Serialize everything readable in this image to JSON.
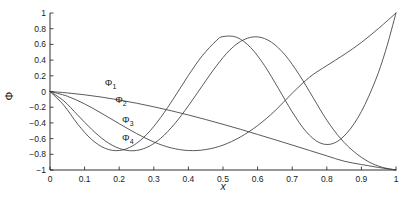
{
  "chart_data": {
    "type": "line",
    "title": "",
    "xlabel": "x",
    "ylabel": "Φ",
    "xlim": [
      0,
      1
    ],
    "ylim": [
      -1,
      1
    ],
    "xticks": [
      "0",
      "0.1",
      "0.2",
      "0.3",
      "0.4",
      "0.5",
      "0.6",
      "0.7",
      "0.8",
      "0.9",
      "1"
    ],
    "xtick_values": [
      0,
      0.1,
      0.2,
      0.3,
      0.4,
      0.5,
      0.6,
      0.7,
      0.8,
      0.9,
      1
    ],
    "yticks": [
      "1",
      "0.8",
      "0.6",
      "0.4",
      "0.2",
      "0",
      "-0.2",
      "-0.4",
      "-0.6",
      "-0.8",
      "-1"
    ],
    "ytick_values": [
      1,
      0.8,
      0.6,
      0.4,
      0.2,
      0,
      -0.2,
      -0.4,
      -0.6,
      -0.8,
      -1
    ],
    "grid": false,
    "legend": "inline-annotations",
    "line_color": "#3c3c3c",
    "annotations": [
      {
        "label": "Φ",
        "sub": "1",
        "x": 0.175,
        "y": 0.1
      },
      {
        "label": "Φ",
        "sub": "2",
        "x": 0.205,
        "y": -0.12
      },
      {
        "label": "Φ",
        "sub": "3",
        "x": 0.225,
        "y": -0.38
      },
      {
        "label": "Φ",
        "sub": "4",
        "x": 0.225,
        "y": -0.6
      }
    ],
    "series": [
      {
        "name": "Φ₁",
        "x": [
          0,
          0.05,
          0.1,
          0.15,
          0.2,
          0.25,
          0.3,
          0.35,
          0.4,
          0.45,
          0.5,
          0.55,
          0.6,
          0.65,
          0.7,
          0.75,
          0.8,
          0.85,
          0.9,
          0.95,
          1
        ],
        "y": [
          0,
          -0.018,
          -0.042,
          -0.072,
          -0.108,
          -0.149,
          -0.195,
          -0.245,
          -0.299,
          -0.357,
          -0.418,
          -0.481,
          -0.547,
          -0.614,
          -0.682,
          -0.751,
          -0.82,
          -0.888,
          -0.93,
          -0.968,
          -1
        ]
      },
      {
        "name": "Φ₂",
        "x": [
          0,
          0.05,
          0.1,
          0.15,
          0.2,
          0.25,
          0.3,
          0.35,
          0.4,
          0.45,
          0.5,
          0.55,
          0.6,
          0.65,
          0.7,
          0.75,
          0.8,
          0.85,
          0.9,
          0.95,
          1
        ],
        "y": [
          0,
          -0.06,
          -0.158,
          -0.28,
          -0.41,
          -0.535,
          -0.643,
          -0.718,
          -0.752,
          -0.74,
          -0.683,
          -0.58,
          -0.434,
          -0.247,
          -0.022,
          0.182,
          0.33,
          0.47,
          0.625,
          0.805,
          1
        ]
      },
      {
        "name": "Φ₃",
        "x": [
          0,
          0.04,
          0.08,
          0.12,
          0.16,
          0.2,
          0.24,
          0.28,
          0.32,
          0.36,
          0.4,
          0.44,
          0.48,
          0.52,
          0.56,
          0.6,
          0.64,
          0.68,
          0.72,
          0.76,
          0.8,
          0.84,
          0.88,
          0.92,
          0.96,
          1
        ],
        "y": [
          0,
          -0.12,
          -0.3,
          -0.48,
          -0.63,
          -0.725,
          -0.755,
          -0.712,
          -0.596,
          -0.413,
          -0.182,
          0.072,
          0.32,
          0.53,
          0.66,
          0.696,
          0.628,
          0.462,
          0.215,
          -0.075,
          -0.365,
          -0.6,
          -0.772,
          -0.893,
          -0.965,
          -1
        ]
      },
      {
        "name": "Φ₄",
        "x": [
          0,
          0.04,
          0.08,
          0.12,
          0.16,
          0.2,
          0.24,
          0.28,
          0.32,
          0.36,
          0.4,
          0.44,
          0.48,
          0.5,
          0.54,
          0.58,
          0.62,
          0.66,
          0.7,
          0.74,
          0.78,
          0.82,
          0.86,
          0.9,
          0.94,
          0.97,
          1
        ],
        "y": [
          0,
          -0.175,
          -0.415,
          -0.61,
          -0.725,
          -0.752,
          -0.69,
          -0.545,
          -0.33,
          -0.07,
          0.205,
          0.455,
          0.645,
          0.7,
          0.69,
          0.56,
          0.33,
          0.04,
          -0.26,
          -0.51,
          -0.655,
          -0.66,
          -0.52,
          -0.255,
          0.135,
          0.52,
          1
        ]
      }
    ]
  }
}
